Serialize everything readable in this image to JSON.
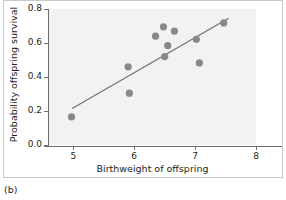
{
  "caption": "(b)",
  "chart_data": {
    "type": "scatter",
    "title": "",
    "subtitle": "",
    "xlabel": "Birthweight of offspring",
    "ylabel": "Probability offspring survival",
    "xlim": [
      4.6,
      8.0
    ],
    "ylim": [
      0.0,
      0.8
    ],
    "xticks": [
      5,
      6,
      7,
      8
    ],
    "xtick_labels": [
      "5",
      "6",
      "7",
      "8"
    ],
    "yticks": [
      0.0,
      0.2,
      0.4,
      0.6,
      0.8
    ],
    "ytick_labels": [
      "0.0",
      "0.2",
      "0.4",
      "0.6",
      "0.8"
    ],
    "grid": false,
    "legend": null,
    "point_color": "#85898c",
    "line_color": "#6d6e70",
    "panel_color": "#f2f2f2",
    "points": [
      {
        "x": 4.97,
        "y": 0.165
      },
      {
        "x": 5.9,
        "y": 0.46
      },
      {
        "x": 5.92,
        "y": 0.305
      },
      {
        "x": 6.35,
        "y": 0.64
      },
      {
        "x": 6.48,
        "y": 0.695
      },
      {
        "x": 6.5,
        "y": 0.52
      },
      {
        "x": 6.55,
        "y": 0.585
      },
      {
        "x": 6.66,
        "y": 0.67
      },
      {
        "x": 7.02,
        "y": 0.622
      },
      {
        "x": 7.07,
        "y": 0.483
      },
      {
        "x": 7.47,
        "y": 0.718
      }
    ],
    "fit_line": {
      "type": "linear-regression",
      "x_start": 4.98,
      "y_start": 0.215,
      "x_end": 7.55,
      "y_end": 0.745
    }
  }
}
